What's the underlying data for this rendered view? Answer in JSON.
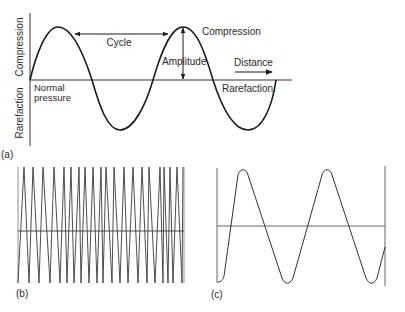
{
  "panel_a": {
    "tag": "(a)",
    "y_axis_top_label": "Compression",
    "y_axis_bottom_label": "Rarefaction",
    "baseline_label_line1": "Normal",
    "baseline_label_line2": "pressure",
    "cycle_label": "Cycle",
    "amplitude_label": "Amplitude",
    "peak_label": "Compression",
    "trough_label": "Rarefaction",
    "direction_label": "Distance"
  },
  "panel_b": {
    "tag": "(b)",
    "description": "High-frequency waveform (many cycles)"
  },
  "panel_c": {
    "tag": "(c)",
    "description": "Low-frequency waveform (about two cycles)"
  },
  "colors": {
    "line": "#1a1a1a",
    "grey_line": "#555555",
    "text": "#2a2a2a",
    "background": "#ffffff"
  }
}
